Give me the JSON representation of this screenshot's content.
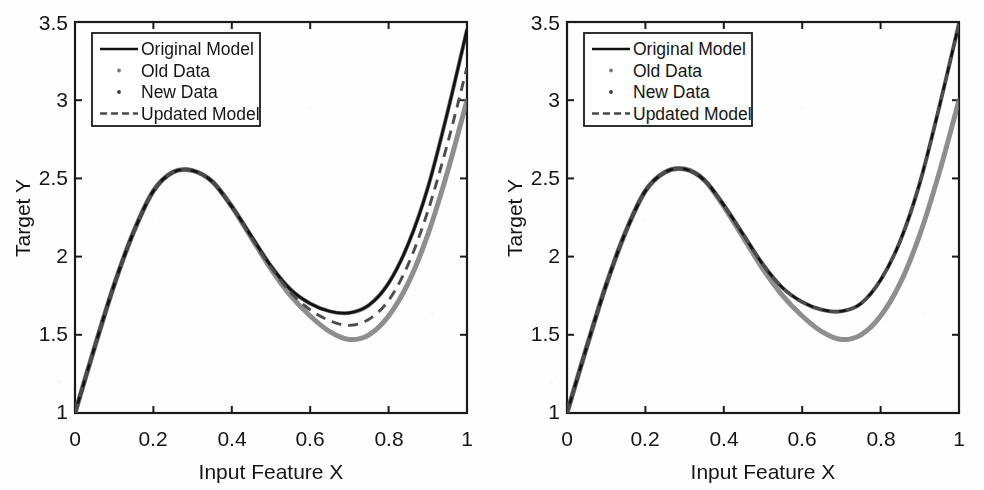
{
  "figure": {
    "panel_count": 2,
    "background_color": "#fefefe"
  },
  "axes": {
    "xlabel": "Input Feature X",
    "ylabel": "Target Y",
    "xticks": [
      "0",
      "0.2",
      "0.4",
      "0.6",
      "0.8",
      "1"
    ],
    "yticks": [
      "1",
      "1.5",
      "2",
      "2.5",
      "3",
      "3.5"
    ],
    "xlim": [
      0,
      1
    ],
    "ylim": [
      1,
      3.5
    ]
  },
  "legend": {
    "items": [
      {
        "label": "Original Model",
        "marker": "solid-line",
        "color": "#111111"
      },
      {
        "label": "Old Data",
        "marker": "dot",
        "color": "#7a7a7a"
      },
      {
        "label": "New Data",
        "marker": "dot",
        "color": "#3a3a3a"
      },
      {
        "label": "Updated Model",
        "marker": "dashed-line",
        "color": "#4a4a4a"
      }
    ]
  },
  "colors": {
    "original_model": "#111111",
    "old_data": "#6e6e6e",
    "new_data": "#3a3a3a",
    "updated_model": "#4d4d4d",
    "axis": "#1a1a1a"
  },
  "chart_data": {
    "type": "line",
    "title": "",
    "xlabel": "Input Feature X",
    "ylabel": "Target Y",
    "xlim": [
      0,
      1
    ],
    "ylim": [
      1,
      3.5
    ],
    "grid": false,
    "legend_position": "upper-left",
    "panels": [
      {
        "name": "left-panel",
        "description": "Updated model lies between the original model and the data curve",
        "x": [
          0,
          0.05,
          0.1,
          0.15,
          0.2,
          0.25,
          0.3,
          0.35,
          0.4,
          0.45,
          0.5,
          0.55,
          0.6,
          0.65,
          0.7,
          0.75,
          0.8,
          0.85,
          0.9,
          0.95,
          1
        ],
        "series": [
          {
            "name": "Original Model",
            "style": "solid",
            "color": "#111111",
            "values": [
              1.0,
              1.42,
              1.82,
              2.16,
              2.42,
              2.54,
              2.55,
              2.48,
              2.32,
              2.13,
              1.94,
              1.79,
              1.7,
              1.65,
              1.64,
              1.69,
              1.83,
              2.08,
              2.44,
              2.92,
              3.45
            ]
          },
          {
            "name": "Old Data",
            "style": "scatter-dense",
            "color": "#6e6e6e",
            "values": [
              1.0,
              1.42,
              1.82,
              2.16,
              2.42,
              2.54,
              2.55,
              2.48,
              2.32,
              2.12,
              1.92,
              1.75,
              1.62,
              1.52,
              1.47,
              1.5,
              1.62,
              1.83,
              2.14,
              2.54,
              3.0
            ]
          },
          {
            "name": "New Data",
            "style": "scatter-dense",
            "color": "#3a3a3a",
            "values": [
              1.0,
              1.42,
              1.82,
              2.16,
              2.42,
              2.54,
              2.55,
              2.48,
              2.32,
              2.13,
              1.94,
              1.79,
              1.7,
              1.65,
              1.64,
              1.69,
              1.83,
              2.08,
              2.44,
              2.92,
              3.45
            ]
          },
          {
            "name": "Updated Model",
            "style": "dashed",
            "color": "#4d4d4d",
            "values": [
              1.0,
              1.42,
              1.82,
              2.16,
              2.42,
              2.54,
              2.55,
              2.48,
              2.32,
              2.12,
              1.93,
              1.77,
              1.66,
              1.59,
              1.56,
              1.6,
              1.72,
              1.95,
              2.29,
              2.72,
              3.21
            ]
          }
        ]
      },
      {
        "name": "right-panel",
        "description": "Updated model has converged onto the original model; only two bands visible",
        "x": [
          0,
          0.05,
          0.1,
          0.15,
          0.2,
          0.25,
          0.3,
          0.35,
          0.4,
          0.45,
          0.5,
          0.55,
          0.6,
          0.65,
          0.7,
          0.75,
          0.8,
          0.85,
          0.9,
          0.95,
          1
        ],
        "series": [
          {
            "name": "Original Model",
            "style": "solid",
            "color": "#111111",
            "values": [
              1.0,
              1.42,
              1.82,
              2.16,
              2.42,
              2.54,
              2.56,
              2.49,
              2.33,
              2.14,
              1.95,
              1.8,
              1.71,
              1.66,
              1.65,
              1.7,
              1.85,
              2.1,
              2.47,
              2.96,
              3.49
            ]
          },
          {
            "name": "Old Data",
            "style": "scatter-dense",
            "color": "#6e6e6e",
            "values": [
              1.0,
              1.42,
              1.82,
              2.16,
              2.42,
              2.54,
              2.56,
              2.49,
              2.32,
              2.12,
              1.92,
              1.75,
              1.62,
              1.52,
              1.47,
              1.5,
              1.62,
              1.83,
              2.14,
              2.54,
              3.0
            ]
          },
          {
            "name": "New Data",
            "style": "scatter-dense",
            "color": "#3a3a3a",
            "values": [
              1.0,
              1.42,
              1.82,
              2.16,
              2.42,
              2.54,
              2.56,
              2.49,
              2.33,
              2.14,
              1.95,
              1.8,
              1.71,
              1.66,
              1.65,
              1.7,
              1.85,
              2.1,
              2.47,
              2.96,
              3.49
            ]
          },
          {
            "name": "Updated Model",
            "style": "dashed",
            "color": "#4d4d4d",
            "values": [
              1.0,
              1.42,
              1.82,
              2.16,
              2.42,
              2.54,
              2.56,
              2.49,
              2.33,
              2.14,
              1.95,
              1.8,
              1.71,
              1.66,
              1.65,
              1.7,
              1.85,
              2.1,
              2.47,
              2.96,
              3.49
            ]
          }
        ]
      }
    ]
  }
}
